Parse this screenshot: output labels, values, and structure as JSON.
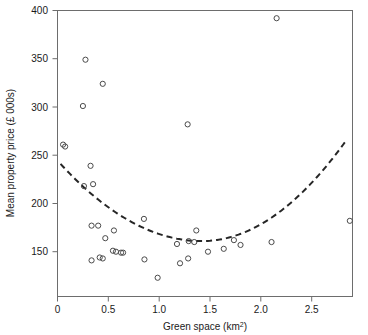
{
  "chart_data": {
    "type": "scatter",
    "title": "",
    "xlabel": "Green space (km2)",
    "xlabel_base": "Green space (km",
    "xlabel_sup": "2",
    "xlabel_tail": ")",
    "ylabel": "Mean property price (£ 000s)",
    "xlim": [
      0,
      2.95
    ],
    "ylim": [
      118,
      400
    ],
    "grid": false,
    "legend": "none",
    "xticks": [
      0,
      0.5,
      1.0,
      1.5,
      2.0,
      2.5
    ],
    "xticklabels": [
      "0",
      "0.5",
      "1.0",
      "1.5",
      "2.0",
      "2.5"
    ],
    "yticks": [
      150,
      200,
      250,
      300,
      350,
      400
    ],
    "yticklabels": [
      "150",
      "200",
      "250",
      "300",
      "350",
      "400"
    ],
    "marker": "open-circle",
    "marker_color": "#4a4a4a",
    "points": [
      {
        "x": 0.055,
        "y": 261
      },
      {
        "x": 0.075,
        "y": 259
      },
      {
        "x": 0.25,
        "y": 301
      },
      {
        "x": 0.275,
        "y": 349
      },
      {
        "x": 0.26,
        "y": 218
      },
      {
        "x": 0.445,
        "y": 324
      },
      {
        "x": 0.325,
        "y": 239
      },
      {
        "x": 0.35,
        "y": 220
      },
      {
        "x": 0.335,
        "y": 177
      },
      {
        "x": 0.4,
        "y": 177
      },
      {
        "x": 0.335,
        "y": 141
      },
      {
        "x": 0.415,
        "y": 144
      },
      {
        "x": 0.445,
        "y": 143
      },
      {
        "x": 0.47,
        "y": 164
      },
      {
        "x": 0.555,
        "y": 172
      },
      {
        "x": 0.545,
        "y": 151
      },
      {
        "x": 0.575,
        "y": 150
      },
      {
        "x": 0.625,
        "y": 149
      },
      {
        "x": 0.645,
        "y": 149
      },
      {
        "x": 0.85,
        "y": 184
      },
      {
        "x": 0.855,
        "y": 142
      },
      {
        "x": 0.985,
        "y": 123
      },
      {
        "x": 1.175,
        "y": 158
      },
      {
        "x": 1.205,
        "y": 138
      },
      {
        "x": 1.28,
        "y": 282
      },
      {
        "x": 1.285,
        "y": 143
      },
      {
        "x": 1.29,
        "y": 161
      },
      {
        "x": 1.345,
        "y": 160
      },
      {
        "x": 1.365,
        "y": 172
      },
      {
        "x": 1.48,
        "y": 150
      },
      {
        "x": 1.635,
        "y": 153
      },
      {
        "x": 1.735,
        "y": 162
      },
      {
        "x": 1.8,
        "y": 157
      },
      {
        "x": 2.105,
        "y": 160
      },
      {
        "x": 2.155,
        "y": 392
      },
      {
        "x": 2.875,
        "y": 182
      }
    ],
    "fit": {
      "type": "quadratic-dashed",
      "description": "U-shaped dashed trend line",
      "vertex_x": 1.42,
      "vertex_y": 161,
      "start": {
        "x": 0.03,
        "y": 241
      },
      "end": {
        "x": 2.83,
        "y": 264
      }
    }
  },
  "axis": {
    "x_tick_count": 6,
    "y_tick_count": 6
  }
}
